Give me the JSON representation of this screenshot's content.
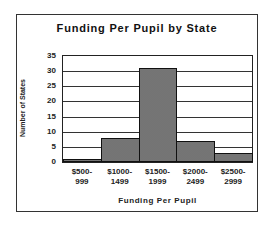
{
  "chart_data": {
    "type": "bar",
    "title": "Funding Per Pupil by State",
    "xlabel": "Funding Per Pupil",
    "ylabel": "Number of States",
    "categories": [
      "$500-999",
      "$1000-1499",
      "$1500-1999",
      "$2000-2499",
      "$2500-2999"
    ],
    "category_lines": [
      [
        "$500-",
        "999"
      ],
      [
        "$1000-",
        "1499"
      ],
      [
        "$1500-",
        "1999"
      ],
      [
        "$2000-",
        "2499"
      ],
      [
        "$2500-",
        "2999"
      ]
    ],
    "values": [
      1,
      8,
      31,
      7,
      3
    ],
    "ylim": [
      0,
      35
    ],
    "yticks": [
      0,
      5,
      10,
      15,
      20,
      25,
      30,
      35
    ],
    "grid": true,
    "legend": "none",
    "bar_fill": "#8a8a8a"
  }
}
